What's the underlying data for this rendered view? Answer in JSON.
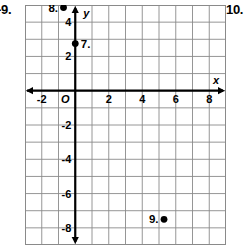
{
  "page": {
    "left_exercise_number": "-9.",
    "right_exercise_number": "10."
  },
  "chart_data": {
    "type": "scatter",
    "title": "",
    "xlabel": "x",
    "ylabel": "y",
    "grid": true,
    "grid_step": 1,
    "xlim": [
      -3,
      9
    ],
    "ylim": [
      -9,
      5
    ],
    "xticks": [
      -2,
      2,
      4,
      6,
      8
    ],
    "xtick_labels": [
      "-2",
      "2",
      "4",
      "6",
      "8"
    ],
    "yticks": [
      2,
      4,
      -2,
      -4,
      -6,
      -8
    ],
    "ytick_labels": [
      "2",
      "4",
      "-2",
      "-4",
      "-6",
      "-8"
    ],
    "origin_label": "O",
    "axis_arrows": [
      "left",
      "right",
      "up",
      "down"
    ],
    "points": [
      {
        "label": "8.",
        "x": -0.7,
        "y": 4.85,
        "label_side": "left"
      },
      {
        "label": "7.",
        "x": 0.0,
        "y": 2.75,
        "label_side": "right"
      },
      {
        "label": "9.",
        "x": 5.3,
        "y": -7.5,
        "label_side": "left"
      }
    ],
    "colors": {
      "grid": "#8a8a8a",
      "axis": "#000000",
      "point": "#000000",
      "background": "#ffffff"
    }
  }
}
